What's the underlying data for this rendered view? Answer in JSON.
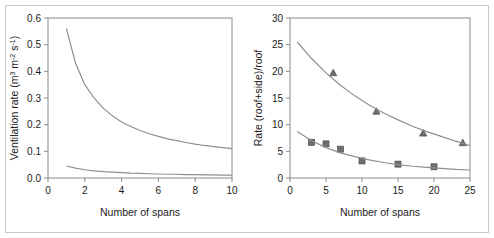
{
  "figure": {
    "background_color": "#ffffff",
    "frame_color": "#c8c8c8",
    "axis_color": "#8a8a8a",
    "curve_color": "#8f8f8f",
    "marker_color": "#6e6e6e"
  },
  "chart_data": [
    {
      "panel": "left",
      "type": "line",
      "title": "",
      "xlabel": "Number of spans",
      "ylabel": "Ventilation rate (m3 m-2 s-1)",
      "ylabel_parts": {
        "prefix": "Ventilation rate (m",
        "sup1": "3",
        "mid1": " m",
        "sup2": "-2",
        "mid2": " s",
        "sup3": "-1",
        "suffix": ")"
      },
      "xlim": [
        0,
        10
      ],
      "ylim": [
        0.0,
        0.6
      ],
      "xticks": [
        0,
        2,
        4,
        6,
        8,
        10
      ],
      "xtick_labels": [
        "0",
        "2",
        "4",
        "6",
        "8",
        "10"
      ],
      "yticks": [
        0.0,
        0.1,
        0.2,
        0.3,
        0.4,
        0.5,
        0.6
      ],
      "ytick_labels": [
        "0.0",
        "0.1",
        "0.2",
        "0.3",
        "0.4",
        "0.5",
        "0.6"
      ],
      "grid": false,
      "legend": "none",
      "series": [
        {
          "name": "upper-ventilation-curve",
          "style": "line",
          "x": [
            1,
            1.5,
            2,
            2.5,
            3,
            3.5,
            4,
            4.5,
            5,
            5.5,
            6,
            6.5,
            7,
            7.5,
            8,
            8.5,
            9,
            9.5,
            10
          ],
          "y": [
            0.56,
            0.43,
            0.35,
            0.3,
            0.262,
            0.233,
            0.21,
            0.193,
            0.178,
            0.166,
            0.156,
            0.147,
            0.14,
            0.133,
            0.127,
            0.122,
            0.118,
            0.114,
            0.11
          ]
        },
        {
          "name": "lower-ventilation-curve",
          "style": "line",
          "x": [
            1,
            1.5,
            2,
            2.5,
            3,
            3.5,
            4,
            4.5,
            5,
            5.5,
            6,
            6.5,
            7,
            7.5,
            8,
            8.5,
            9,
            9.5,
            10
          ],
          "y": [
            0.045,
            0.037,
            0.031,
            0.027,
            0.024,
            0.022,
            0.02,
            0.018,
            0.017,
            0.016,
            0.015,
            0.014,
            0.014,
            0.013,
            0.013,
            0.012,
            0.012,
            0.011,
            0.011
          ]
        }
      ]
    },
    {
      "panel": "right",
      "type": "scatter",
      "title": "",
      "xlabel": "Number of spans",
      "ylabel": "Rate (roof+side)/roof",
      "xlim": [
        0,
        25
      ],
      "ylim": [
        0,
        30
      ],
      "xticks": [
        0,
        5,
        10,
        15,
        20,
        25
      ],
      "xtick_labels": [
        "0",
        "5",
        "10",
        "15",
        "20",
        "25"
      ],
      "yticks": [
        0,
        5,
        10,
        15,
        20,
        25,
        30
      ],
      "ytick_labels": [
        "0",
        "5",
        "10",
        "15",
        "20",
        "25",
        "30"
      ],
      "grid": false,
      "legend": "none",
      "series": [
        {
          "name": "triangle-series",
          "style": "marker-triangle",
          "x": [
            6,
            12,
            18.5,
            24
          ],
          "y": [
            19.7,
            12.5,
            8.4,
            6.6
          ]
        },
        {
          "name": "triangle-fit-curve",
          "style": "line",
          "x": [
            1,
            3,
            5,
            7,
            9,
            11,
            13,
            15,
            17,
            19,
            21,
            23,
            25
          ],
          "y": [
            25.5,
            22.4,
            19.7,
            17.4,
            15.4,
            13.7,
            12.2,
            10.9,
            9.7,
            8.7,
            7.8,
            6.9,
            6.1
          ]
        },
        {
          "name": "square-series",
          "style": "marker-square",
          "x": [
            3,
            5,
            7,
            10,
            15,
            20
          ],
          "y": [
            6.7,
            6.4,
            5.4,
            3.2,
            2.6,
            2.1
          ]
        },
        {
          "name": "square-fit-curve",
          "style": "line",
          "x": [
            1,
            3,
            5,
            7,
            9,
            11,
            13,
            15,
            17,
            19,
            21,
            23,
            25
          ],
          "y": [
            8.7,
            7.0,
            5.7,
            4.7,
            4.0,
            3.4,
            2.9,
            2.5,
            2.2,
            2.0,
            1.8,
            1.6,
            1.5
          ]
        }
      ]
    }
  ]
}
